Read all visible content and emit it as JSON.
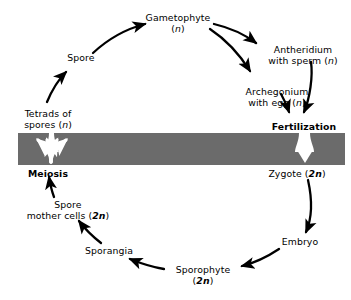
{
  "diagram": {
    "band_color": "#6b6b6b",
    "arrow_color": "#000000",
    "white_arrow_color": "#ffffff",
    "background_color": "#ffffff"
  },
  "nodes": {
    "gametophyte": {
      "line1": "Gametophyte",
      "line2_prefix": "(",
      "line2_italic": "n",
      "line2_suffix": ")"
    },
    "antheridium": {
      "line1": "Antheridium",
      "line2_prefix": "with sperm (",
      "line2_italic": "n",
      "line2_suffix": ")"
    },
    "archegonium": {
      "line1": "Archegonium",
      "line2_prefix": "with egg (",
      "line2_italic": "n",
      "line2_suffix": ")"
    },
    "fertilization": {
      "label": "Fertilization"
    },
    "zygote": {
      "prefix": "Zygote (",
      "bold_italic": "2n",
      "suffix": ")"
    },
    "embryo": {
      "label": "Embryo"
    },
    "sporophyte": {
      "line1": "Sporophyte",
      "line2_prefix": "(",
      "line2_bold_italic": "2n",
      "line2_suffix": ")"
    },
    "sporangia": {
      "label": "Sporangia"
    },
    "spore_mother_cells": {
      "line1": "Spore",
      "line2_prefix": "mother cells (",
      "line2_bold_italic": "2n",
      "line2_suffix": ")"
    },
    "meiosis": {
      "label": "Meiosis"
    },
    "tetrads": {
      "line1": "Tetrads of",
      "line2_prefix": "spores (",
      "line2_italic": "n",
      "line2_suffix": ")"
    },
    "spore": {
      "label": "Spore"
    }
  },
  "phases": {
    "haploid_label": "n",
    "diploid_label": "2n"
  }
}
